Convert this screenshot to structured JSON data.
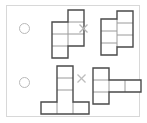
{
  "panel": {
    "background_color": "#ffffff",
    "border_color": "#d8d8d8",
    "shape_stroke_color": "#4a4a4a",
    "grid_stroke_color": "#9a9a9a",
    "marker_color": "#b9b9b9"
  },
  "rows": [
    {
      "id": "row-1",
      "marker": {
        "icon": "radio-circle-empty",
        "selected": false,
        "label": ""
      },
      "separator": {
        "icon": "x-multiply-icon",
        "label": "×"
      },
      "left_shape": {
        "name": "s-tetromino-vertical-left",
        "cells": 6,
        "columns": 2,
        "rows": 4,
        "label": ""
      },
      "right_shape": {
        "name": "s-tetromino-vertical-right",
        "cells": 6,
        "columns": 2,
        "rows": 4,
        "label": ""
      }
    },
    {
      "id": "row-2",
      "marker": {
        "icon": "radio-circle-empty",
        "selected": false,
        "label": ""
      },
      "separator": {
        "icon": "x-multiply-icon",
        "label": "×"
      },
      "left_shape": {
        "name": "t-shape-stem-up",
        "cells": 6,
        "columns": 3,
        "rows": 4,
        "label": ""
      },
      "right_shape": {
        "name": "t-shape-rotated-right",
        "cells": 5,
        "columns": 4,
        "rows": 3,
        "label": ""
      }
    }
  ]
}
